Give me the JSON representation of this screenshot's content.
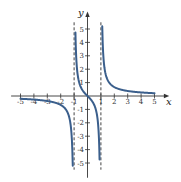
{
  "chart_data": {
    "type": "line",
    "title": "",
    "xlabel": "x",
    "ylabel": "y",
    "xlim": [
      -5,
      5
    ],
    "ylim": [
      -5,
      5
    ],
    "grid": false,
    "x_ticks": [
      "-5",
      "-4",
      "-3",
      "-2",
      "-1",
      "1",
      "2",
      "3",
      "4",
      "5"
    ],
    "y_ticks": [
      "5",
      "4",
      "3",
      "2",
      "1",
      "-1",
      "-2",
      "-3",
      "-4",
      "-5"
    ],
    "asymptotes": {
      "vertical": [
        -1,
        1
      ],
      "horizontal": [
        0
      ],
      "style": "dashed"
    },
    "function": "x/(x^2-1)",
    "series": [
      {
        "name": "left-branch",
        "x": [
          -5,
          -4,
          -3,
          -2,
          -1.5,
          -1.25,
          -1.1
        ],
        "values": [
          -0.21,
          -0.27,
          -0.38,
          -0.67,
          -1.2,
          -2.22,
          -5.24
        ]
      },
      {
        "name": "middle-branch",
        "x": [
          -0.9,
          -0.75,
          -0.5,
          -0.25,
          0,
          0.25,
          0.5,
          0.75,
          0.9
        ],
        "values": [
          4.74,
          1.71,
          0.67,
          0.27,
          0,
          -0.27,
          -0.67,
          -1.71,
          -4.74
        ]
      },
      {
        "name": "right-branch",
        "x": [
          1.1,
          1.25,
          1.5,
          2,
          3,
          4,
          5
        ],
        "values": [
          5.24,
          2.22,
          1.2,
          0.67,
          0.38,
          0.27,
          0.21
        ]
      }
    ],
    "curve_color": "#3b5f8c",
    "axis_color": "#333333"
  }
}
